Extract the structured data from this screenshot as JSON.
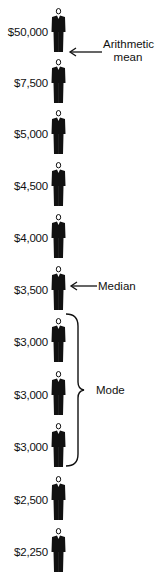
{
  "figure": {
    "people": [
      {
        "salary": "$50,000",
        "top": 8
      },
      {
        "salary": "$7,500",
        "top": 59
      },
      {
        "salary": "$5,000",
        "top": 110
      },
      {
        "salary": "$4,500",
        "top": 162
      },
      {
        "salary": "$4,000",
        "top": 214
      },
      {
        "salary": "$3,500",
        "top": 266
      },
      {
        "salary": "$3,000",
        "top": 318
      },
      {
        "salary": "$3,000",
        "top": 371
      },
      {
        "salary": "$3,000",
        "top": 423
      },
      {
        "salary": "$2,500",
        "top": 476
      },
      {
        "salary": "$2,250",
        "top": 528
      }
    ],
    "annotations": {
      "mean_line1": "Arithmetic",
      "mean_line2": "mean",
      "median": "Median",
      "mode": "Mode"
    },
    "colors": {
      "ink": "#111111",
      "background": "#ffffff"
    }
  }
}
